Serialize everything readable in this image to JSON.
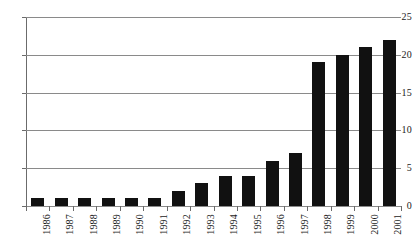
{
  "chart_data": {
    "type": "bar",
    "title": "",
    "subtitle": "",
    "xlabel": "",
    "ylabel": "",
    "categories": [
      "1986",
      "1987",
      "1988",
      "1989",
      "1990",
      "1991",
      "1992",
      "1993",
      "1994",
      "1995",
      "1996",
      "1997",
      "1998",
      "1999",
      "2000",
      "2001"
    ],
    "values": [
      1,
      1,
      1,
      1,
      1,
      1,
      2,
      3,
      4,
      4,
      6,
      7,
      19,
      20,
      21,
      22
    ],
    "ylim": [
      0,
      25
    ],
    "y_ticks": [
      0,
      5,
      10,
      15,
      20,
      25
    ],
    "y_tick_labels": [
      "0",
      "5",
      "10",
      "15",
      "20",
      "25"
    ],
    "grid": "horizontal",
    "legend": "none",
    "series": [
      {
        "name": "",
        "color": "#111111",
        "values": [
          1,
          1,
          1,
          1,
          1,
          1,
          2,
          3,
          4,
          4,
          6,
          7,
          19,
          20,
          21,
          22
        ]
      }
    ],
    "annotations": [],
    "x_tick_label_rotation": -90
  },
  "style": {
    "bar_color": "#111111",
    "gridline_color": "#8a8a8a",
    "axis_color": "#6b6b6b",
    "text_color": "#1a1a1a",
    "background": "#ffffff"
  }
}
